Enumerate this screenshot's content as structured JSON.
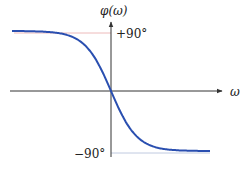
{
  "chart_data": {
    "type": "line",
    "title": "",
    "xlabel": "ω",
    "ylabel": "φ(ω)",
    "y_ticks": [
      "+90°",
      "−90°"
    ],
    "ylim": [
      -90,
      90
    ],
    "grid": false,
    "legend": null,
    "series": [
      {
        "name": "phase response",
        "color": "#2a4fb0",
        "description": "odd-symmetric sigmoid decreasing from +90° (ω→−∞) through 0 at ω=0 to −90° (ω→+∞)",
        "x": [
          -4,
          -3,
          -2,
          -1,
          -0.5,
          0,
          0.5,
          1,
          2,
          3,
          4
        ],
        "y": [
          88,
          85,
          76,
          55,
          31,
          0,
          -31,
          -55,
          -76,
          -85,
          -88
        ]
      }
    ],
    "guides": [
      {
        "y": 90,
        "color": "#e8a0a0"
      },
      {
        "y": -90,
        "color": "#a8b4d8"
      }
    ]
  },
  "labels": {
    "y_axis": "φ(ω)",
    "x_axis": "ω",
    "top_tick": "+90°",
    "bottom_tick": "−90°"
  }
}
